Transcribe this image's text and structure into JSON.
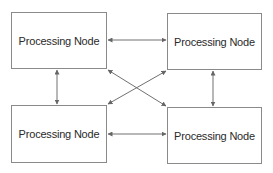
{
  "diagram": {
    "type": "fully-connected network",
    "nodes": [
      {
        "id": "top-left",
        "label": "Processing Node"
      },
      {
        "id": "top-right",
        "label": "Processing Node"
      },
      {
        "id": "bottom-left",
        "label": "Processing Node"
      },
      {
        "id": "bottom-right",
        "label": "Processing Node"
      }
    ],
    "edges": [
      {
        "from": "top-left",
        "to": "top-right",
        "direction": "bidirectional"
      },
      {
        "from": "bottom-left",
        "to": "bottom-right",
        "direction": "bidirectional"
      },
      {
        "from": "top-left",
        "to": "bottom-left",
        "direction": "bidirectional"
      },
      {
        "from": "top-right",
        "to": "bottom-right",
        "direction": "bidirectional"
      },
      {
        "from": "top-left",
        "to": "bottom-right",
        "direction": "bidirectional"
      },
      {
        "from": "top-right",
        "to": "bottom-left",
        "direction": "bidirectional"
      }
    ],
    "colors": {
      "border": "#8a8a8a",
      "arrow": "#707070",
      "text": "#2a2a2a",
      "background": "#ffffff"
    }
  }
}
